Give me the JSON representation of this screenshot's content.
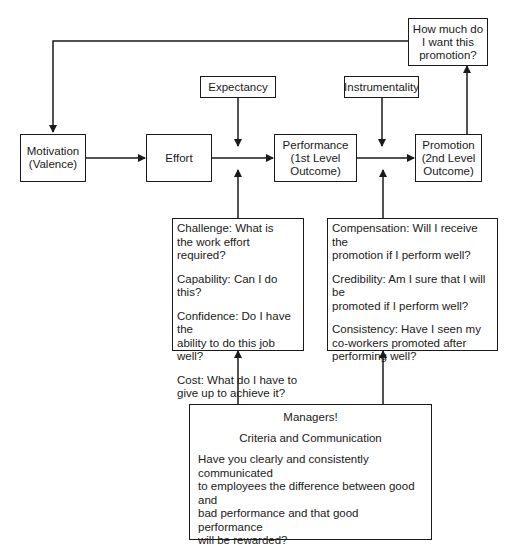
{
  "diagram": {
    "nodes": {
      "motivation": "Motivation\n(Valence)",
      "motivation_l1": "Motivation",
      "motivation_l2": "(Valence)",
      "effort": "Effort",
      "expectancy": "Expectancy",
      "performance_l1": "Performance",
      "performance_l2": "(1st Level",
      "performance_l3": "Outcome)",
      "instrumentality": "Instrumentality",
      "promotion_l1": "Promotion",
      "promotion_l2": "(2nd Level",
      "promotion_l3": "Outcome)",
      "valence_q_l1": "How much do",
      "valence_q_l2": "I want this",
      "valence_q_l3": "promotion?"
    },
    "expectancy_questions": [
      {
        "line1": "Challenge:  What is",
        "line2": "the work effort required?"
      },
      {
        "line1": "Capability:  Can I do this?",
        "line2": ""
      },
      {
        "line1": "Confidence:  Do I have the",
        "line2": "ability to do this job well?"
      },
      {
        "line1": "Cost:  What do I have to",
        "line2": "give up to achieve it?"
      }
    ],
    "instrumentality_questions": [
      {
        "line1": "Compensation:  Will I receive the",
        "line2": "promotion if I perform well?",
        "line3": ""
      },
      {
        "line1": "Credibility:  Am I sure that I will be",
        "line2": "promoted if I perform well?",
        "line3": ""
      },
      {
        "line1": "Consistency:  Have I seen my",
        "line2": "co-workers promoted after",
        "line3": "performing well?"
      }
    ],
    "managers": {
      "title": "Managers!",
      "subtitle": "Criteria and Communication",
      "body_l1": "Have you clearly and consistently communicated",
      "body_l2": "to employees the difference between good and",
      "body_l3": "bad performance and that good performance",
      "body_l4": "will be rewarded?",
      "footer": "How?"
    },
    "edges": [
      {
        "from": "motivation",
        "to": "effort"
      },
      {
        "from": "effort",
        "to": "performance"
      },
      {
        "from": "expectancy",
        "to": "effort-performance-link"
      },
      {
        "from": "expectancy_questions",
        "to": "effort-performance-link"
      },
      {
        "from": "performance",
        "to": "promotion"
      },
      {
        "from": "instrumentality",
        "to": "performance-promotion-link"
      },
      {
        "from": "instrumentality_questions",
        "to": "performance-promotion-link"
      },
      {
        "from": "promotion",
        "to": "valence_question"
      },
      {
        "from": "valence_question",
        "to": "motivation"
      },
      {
        "from": "managers",
        "to": "expectancy_questions"
      },
      {
        "from": "managers",
        "to": "instrumentality_questions"
      }
    ],
    "line_color": "#1a1a1a"
  }
}
